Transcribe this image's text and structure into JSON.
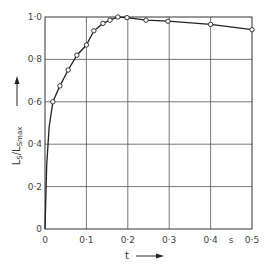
{
  "chart_data": {
    "type": "line",
    "title": "",
    "xlabel": "t",
    "xunit": "s",
    "ylabel": "L_S/L_Smax",
    "ylabel_main": "L",
    "ylabel_sub": "S",
    "ylabel_den_main": "L",
    "ylabel_den_sub": "Smax",
    "xlim": [
      0,
      0.5
    ],
    "ylim": [
      0,
      1.0
    ],
    "grid": true,
    "legend": "none",
    "x_ticks": [
      "0",
      "0·1",
      "0·2",
      "0·3",
      "0·4",
      "0·5"
    ],
    "y_ticks": [
      "0",
      "0·2",
      "0·4",
      "0·6",
      "0·8",
      "1·0"
    ],
    "series": [
      {
        "name": "measured",
        "marker": "open-circle",
        "x": [
          0.019,
          0.036,
          0.056,
          0.077,
          0.1,
          0.118,
          0.14,
          0.157,
          0.176,
          0.198,
          0.244,
          0.297,
          0.4,
          0.5
        ],
        "y": [
          0.6,
          0.675,
          0.75,
          0.82,
          0.868,
          0.935,
          0.97,
          0.985,
          1.0,
          0.997,
          0.985,
          0.98,
          0.965,
          0.94
        ]
      }
    ],
    "curve_starts_at": [
      0,
      0
    ]
  }
}
